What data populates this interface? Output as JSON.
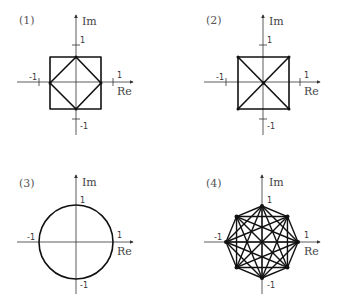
{
  "panels": [
    {
      "label": "(1)",
      "description": "Square with inscribed diamond (rotated square) touching axes at ±1",
      "axes": {
        "x_label": "Re",
        "y_label": "Im",
        "ticks": {
          "x_pos": "1",
          "x_neg": "-1",
          "y_pos": "1",
          "y_neg": "-1"
        }
      },
      "center": [
        76,
        82
      ],
      "unit": 37,
      "half": 26
    },
    {
      "label": "(2)",
      "description": "Square with both diagonals crossing at origin",
      "axes": {
        "x_label": "Re",
        "y_label": "Im",
        "ticks": {
          "x_pos": "1",
          "x_neg": "-1",
          "y_pos": "1",
          "y_neg": "-1"
        }
      },
      "center": [
        263,
        82
      ],
      "unit": 37,
      "half": 26
    },
    {
      "label": "(3)",
      "description": "Unit circle",
      "axes": {
        "x_label": "Re",
        "y_label": "Im",
        "ticks": {
          "x_pos": "1",
          "x_neg": "-1",
          "y_pos": "1",
          "y_neg": "-1"
        }
      },
      "center": [
        76,
        242
      ],
      "radius": 37
    },
    {
      "label": "(4)",
      "description": "Regular octagon on unit circle with all chords (complete graph K8)",
      "axes": {
        "x_label": "Re",
        "y_label": "Im",
        "ticks": {
          "x_pos": "1",
          "x_neg": "-1",
          "y_pos": "1",
          "y_neg": "-1"
        }
      },
      "center": [
        262,
        242
      ],
      "radius": 36,
      "vertices": 8
    }
  ]
}
